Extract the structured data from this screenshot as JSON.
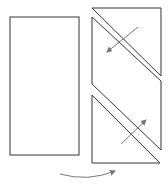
{
  "diagram": {
    "colors": {
      "outline": "#333333",
      "arrow": "#777777",
      "background": "#ffffff"
    },
    "original_rectangle": {
      "x": 10,
      "y": 17,
      "width": 69,
      "height": 138
    },
    "pieces": [
      {
        "name": "top-triangle",
        "points": "92,8 161,8 161,76"
      },
      {
        "name": "middle-parallelogram",
        "points": "92,17 161,81 161,150 92,84"
      },
      {
        "name": "bottom-triangle",
        "points": "92,95 160,163 92,163"
      }
    ],
    "arrows": [
      {
        "name": "slide-arrow-down-left",
        "x1": 138,
        "y1": 27,
        "x2": 107,
        "y2": 52
      },
      {
        "name": "slide-arrow-up-right",
        "x1": 121,
        "y1": 144,
        "x2": 146,
        "y2": 120
      }
    ],
    "transform_arrow": {
      "path": "M60,174 Q88,182 115,171"
    }
  }
}
